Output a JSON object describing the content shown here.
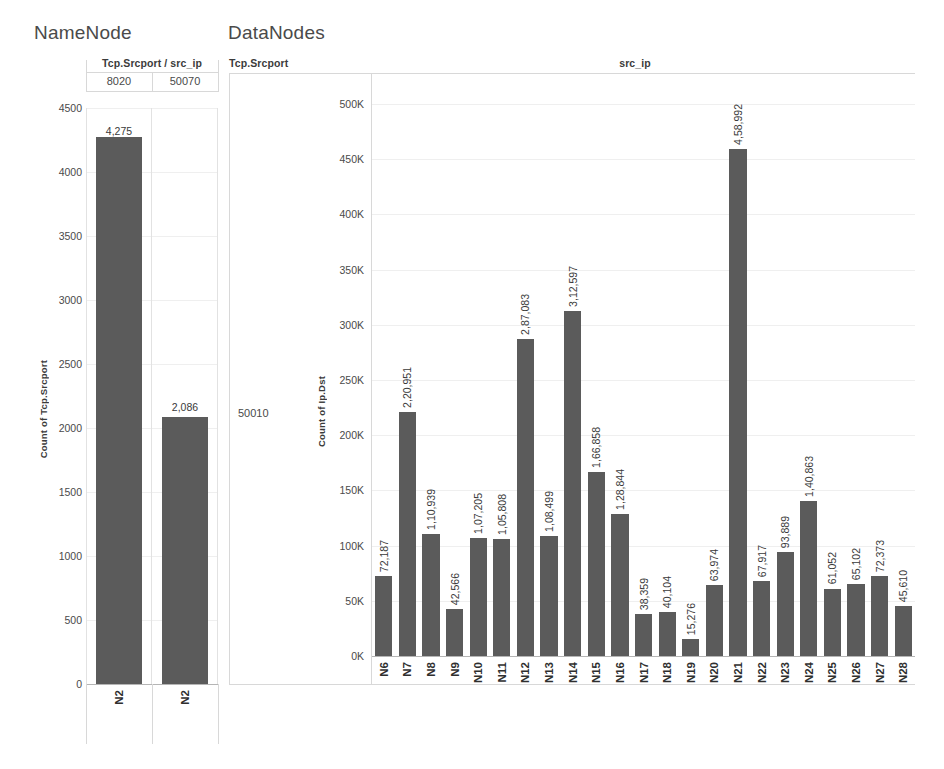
{
  "dashboard": {
    "left_panel": {
      "title": "NameNode",
      "column_header_label": "Tcp.Srcport / src_ip",
      "column_values": [
        "8020",
        "50070"
      ],
      "y_axis_title": "Count of Tcp.Srcport"
    },
    "right_panel": {
      "title": "DataNodes",
      "column_header_label": "Tcp.Srcport",
      "column_group_label": "src_ip",
      "row_header_value": "50010",
      "y_axis_title": "Count of Ip.Dst"
    },
    "colors": {
      "bar": "#5b5b5b",
      "grid": "#efefef",
      "frame": "#d8d8d8",
      "text": "#3a3a3a"
    }
  },
  "chart_data": [
    {
      "type": "bar",
      "title": "NameNode",
      "xlabel": "Tcp.Srcport / src_ip",
      "ylabel": "Count of Tcp.Srcport",
      "ylim": [
        0,
        4500
      ],
      "yticks": [
        "4500",
        "4000",
        "3500",
        "3000",
        "2500",
        "2000",
        "1500",
        "1000",
        "500",
        "0"
      ],
      "ytick_values": [
        4500,
        4000,
        3500,
        3000,
        2500,
        2000,
        1500,
        1000,
        500,
        0
      ],
      "grid": true,
      "legend": "none",
      "groups": [
        "8020",
        "50070"
      ],
      "categories": [
        "N2",
        "N2"
      ],
      "values": [
        4275,
        2086
      ],
      "value_labels": [
        "4,275",
        "2,086"
      ]
    },
    {
      "type": "bar",
      "title": "DataNodes",
      "xlabel": "src_ip",
      "ylabel": "Count of Ip.Dst",
      "row_header": "50010",
      "column_header": "Tcp.Srcport",
      "ylim": [
        0,
        500000
      ],
      "yticks": [
        "500K",
        "450K",
        "400K",
        "350K",
        "300K",
        "250K",
        "200K",
        "150K",
        "100K",
        "50K",
        "0K"
      ],
      "ytick_values": [
        500000,
        450000,
        400000,
        350000,
        300000,
        250000,
        200000,
        150000,
        100000,
        50000,
        0
      ],
      "grid": true,
      "legend": "none",
      "categories": [
        "N6",
        "N7",
        "N8",
        "N9",
        "N10",
        "N11",
        "N12",
        "N13",
        "N14",
        "N15",
        "N16",
        "N17",
        "N18",
        "N19",
        "N20",
        "N21",
        "N22",
        "N23",
        "N24",
        "N25",
        "N26",
        "N27",
        "N28"
      ],
      "values": [
        72187,
        220951,
        110939,
        42566,
        107205,
        105808,
        287083,
        108499,
        312597,
        166858,
        128844,
        38359,
        40104,
        15276,
        63974,
        458992,
        67917,
        93889,
        140863,
        61052,
        65102,
        72373,
        45610
      ],
      "value_labels": [
        "72,187",
        "2,20,951",
        "1,10,939",
        "42,566",
        "1,07,205",
        "1,05,808",
        "2,87,083",
        "1,08,499",
        "3,12,597",
        "1,66,858",
        "1,28,844",
        "38,359",
        "40,104",
        "15,276",
        "63,974",
        "4,58,992",
        "67,917",
        "93,889",
        "1,40,863",
        "61,052",
        "65,102",
        "72,373",
        "45,610"
      ]
    }
  ]
}
